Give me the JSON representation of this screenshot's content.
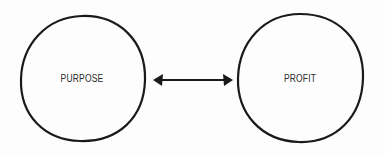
{
  "diagram": {
    "nodes": [
      {
        "id": "purpose",
        "label": "PURPOSE"
      },
      {
        "id": "profit",
        "label": "PROFIT"
      }
    ],
    "edges": [
      {
        "from": "purpose",
        "to": "profit",
        "type": "bidirectional-arrow"
      }
    ],
    "colors": {
      "stroke": "#1a1a1a",
      "text": "#2a2a2a",
      "background": "#fdfdfd"
    }
  }
}
